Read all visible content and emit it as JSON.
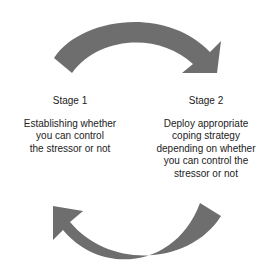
{
  "diagram": {
    "type": "cycle",
    "arrow_color": "#6e6e6e",
    "stages": [
      {
        "title": "Stage 1",
        "description_lines": [
          "Establishing whether",
          "you can control",
          "the stressor or not"
        ]
      },
      {
        "title": "Stage 2",
        "description_lines": [
          "Deploy appropriate",
          "coping strategy",
          "depending on whether",
          "you can control the",
          "stressor or not"
        ]
      }
    ],
    "arrows": [
      {
        "from": "Stage 1",
        "to": "Stage 2",
        "position": "top",
        "direction": "clockwise"
      },
      {
        "from": "Stage 2",
        "to": "Stage 1",
        "position": "bottom",
        "direction": "clockwise"
      }
    ]
  }
}
